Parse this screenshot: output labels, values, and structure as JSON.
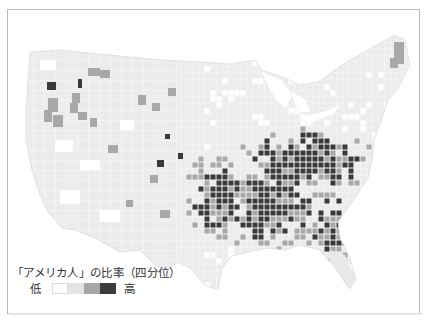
{
  "map": {
    "title": "「アメリカ人」の比率（四分位）",
    "subject": "US counties shaded by share reporting ancestry as 'American'",
    "legend": {
      "title": "「アメリカ人」の比率（四分位）",
      "low_label": "低",
      "high_label": "高",
      "quartiles": [
        {
          "label": "Q1",
          "color": "#ffffff",
          "border": "#dcdcdc"
        },
        {
          "label": "Q2",
          "color": "#e4e4e4",
          "border": "#e4e4e4"
        },
        {
          "label": "Q3",
          "color": "#a6a6a6",
          "border": "#a6a6a6"
        },
        {
          "label": "Q4",
          "color": "#3c3c3c",
          "border": "#3c3c3c"
        }
      ]
    },
    "colors": {
      "background": "#ffffff",
      "land_base": "#eeeeee",
      "county_line": "#ffffff",
      "frame": "#b8b8b8",
      "text": "#333333"
    }
  }
}
